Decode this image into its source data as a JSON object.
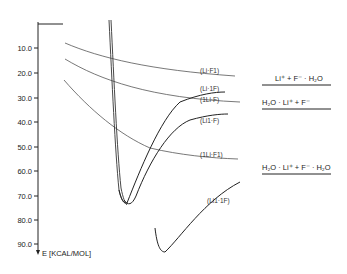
{
  "axis": {
    "label": "E [KCAL/MOL]",
    "ticks": [
      "10.0",
      "20.0",
      "30.0",
      "40.0",
      "50.0",
      "60.0",
      "70.0",
      "80.0",
      "90.0"
    ]
  },
  "curves": [
    {
      "label": "(Li·F1)"
    },
    {
      "label": "(Li·1F)"
    },
    {
      "label": "(1Li·F)"
    },
    {
      "label": "(Li1·F)"
    },
    {
      "label": "(1Li·F1)"
    },
    {
      "label": "(Li1·1F)"
    }
  ],
  "levels": [
    {
      "label": "Li⁺ + F⁻ · H₂O"
    },
    {
      "label": "H₂O · Li⁺ + F⁻"
    },
    {
      "label": "H₂O · Li⁺ + F⁻ · H₂O"
    }
  ],
  "colors": {
    "ink": "#222222",
    "thin": "#555555",
    "background": "#ffffff"
  }
}
